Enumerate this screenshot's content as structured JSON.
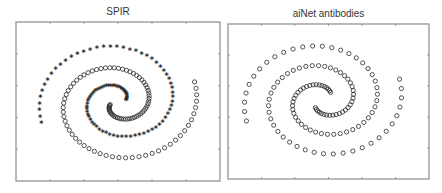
{
  "chart_data": [
    {
      "type": "scatter",
      "title": "SPIR",
      "xlabel": "",
      "ylabel": "",
      "grid": false,
      "legend": null,
      "xlim": [
        -1,
        1
      ],
      "ylim": [
        -1,
        1
      ],
      "x_ticks": 5,
      "y_ticks": 4,
      "tick_labels_visible": false,
      "series": [
        {
          "name": "spiral-1",
          "marker": "star",
          "points_count": 97,
          "shape": "archimedean spiral, ~1.6 turns counterclockwise from center",
          "start_angle_rad": 0.25,
          "end_angle_rad": 9.75,
          "radius_start": 0.08,
          "radius_end": 0.8
        },
        {
          "name": "spiral-2",
          "marker": "circle",
          "points_count": 97,
          "shape": "archimedean spiral, ~1.6 turns, rotated 180 degrees from spiral-1",
          "start_angle_rad": 3.39,
          "end_angle_rad": 12.89,
          "radius_start": 0.08,
          "radius_end": 0.8
        }
      ]
    },
    {
      "type": "scatter",
      "title": "aiNet antibodies",
      "xlabel": "",
      "ylabel": "",
      "grid": false,
      "legend": null,
      "xlim": [
        -1,
        1
      ],
      "ylim": [
        -1,
        1
      ],
      "x_ticks": 5,
      "y_ticks": 4,
      "tick_labels_visible": false,
      "series": [
        {
          "name": "antibodies-spiral-1",
          "marker": "circle",
          "points_count": 62,
          "start_angle_rad": 0.9,
          "end_angle_rad": 9.75,
          "radius_start": 0.12,
          "radius_end": 0.8
        },
        {
          "name": "antibodies-spiral-2",
          "marker": "circle",
          "points_count": 62,
          "start_angle_rad": 4.04,
          "end_angle_rad": 12.89,
          "radius_start": 0.12,
          "radius_end": 0.8
        }
      ]
    }
  ],
  "panels": {
    "left": {
      "title": "SPIR"
    },
    "right": {
      "title": "aiNet antibodies"
    }
  },
  "colors": {
    "frame": "#8a8a8a",
    "marker": "#2a2a2a",
    "title": "#333333",
    "background": "#ffffff"
  }
}
